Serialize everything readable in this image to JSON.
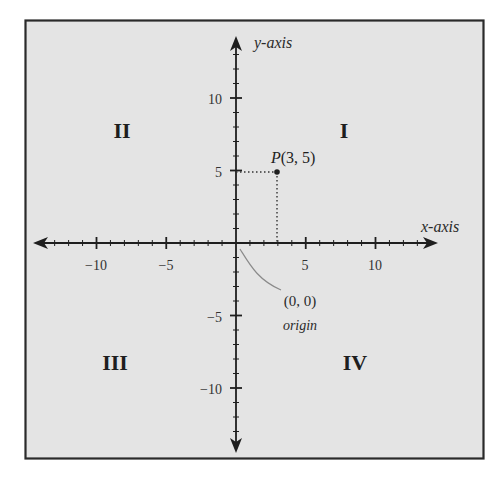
{
  "diagram": {
    "colors": {
      "background": "#ffffff",
      "panel": "#e4e4e4",
      "frame": "#2a2a2a",
      "ink": "#1e1e1e",
      "leader": "#8a8a8a"
    },
    "axes": {
      "x_label": "x-axis",
      "y_label": "y-axis",
      "x_ticks": [
        {
          "value": -10,
          "label": "−10"
        },
        {
          "value": -5,
          "label": "−5"
        },
        {
          "value": 5,
          "label": "5"
        },
        {
          "value": 10,
          "label": "10"
        }
      ],
      "y_ticks": [
        {
          "value": 10,
          "label": "10"
        },
        {
          "value": 5,
          "label": "5"
        },
        {
          "value": -5,
          "label": "−5"
        },
        {
          "value": -10,
          "label": "−10"
        }
      ],
      "range": {
        "x": [
          -14,
          14
        ],
        "y": [
          -14,
          14
        ]
      },
      "minor_tick_step": 1,
      "major_tick_step": 5
    },
    "quadrants": [
      {
        "id": "I",
        "label": "I"
      },
      {
        "id": "II",
        "label": "II"
      },
      {
        "id": "III",
        "label": "III"
      },
      {
        "id": "IV",
        "label": "IV"
      }
    ],
    "point": {
      "name": "P",
      "x": 3,
      "y": 5,
      "label_name": "P",
      "label_coords": "(3, 5)"
    },
    "origin": {
      "coords_label": "(0, 0)",
      "name_label": "origin"
    }
  }
}
